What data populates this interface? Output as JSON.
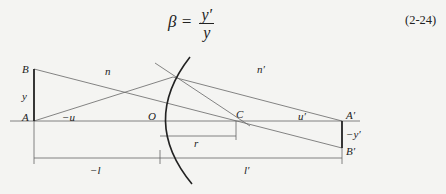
{
  "equation": {
    "lhs": "β =",
    "numerator": "y′",
    "denominator": "y",
    "number": "(2-24)"
  },
  "labels": {
    "B": "B",
    "y": "y",
    "A": "A",
    "u": "−u",
    "n": "n",
    "O": "O",
    "C": "C",
    "n_prime": "n′",
    "u_prime": "u′",
    "A_prime": "A′",
    "neg_y_prime": "−y′",
    "B_prime": "B′",
    "r": "r",
    "neg_l": "−l",
    "l_prime": "l′"
  },
  "colors": {
    "line": "#555555",
    "bold": "#222222",
    "background": "#f4f4f2"
  }
}
